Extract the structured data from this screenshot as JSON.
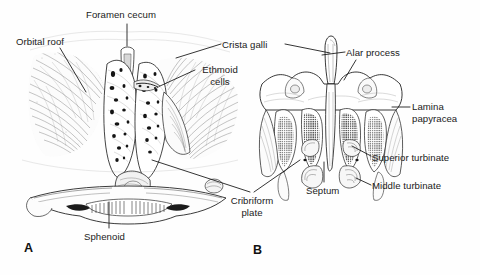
{
  "figure": {
    "kind": "anatomical-line-drawing",
    "ink_color": "#1b1b1b",
    "background_color": "#fefefe"
  },
  "panels": [
    {
      "letter": "A",
      "caption_x": 24,
      "caption_y": 241
    },
    {
      "letter": "B",
      "caption_x": 253,
      "caption_y": 243
    }
  ],
  "labels": [
    {
      "name": "orbital-roof",
      "text": "Orbital roof",
      "x": 16,
      "y": 36,
      "align": "left",
      "width": 74
    },
    {
      "name": "foramen-cecum",
      "text": "Foramen cecum",
      "x": 86,
      "y": 9,
      "align": "left",
      "width": 86
    },
    {
      "name": "crista-galli",
      "text": "Crista galli",
      "x": 222,
      "y": 39,
      "align": "left",
      "width": 62
    },
    {
      "name": "ethmoid-cells",
      "text": "Ethmoid\ncells",
      "x": 196,
      "y": 64,
      "align": "left",
      "width": 48
    },
    {
      "name": "alar-process",
      "text": "Alar process",
      "x": 346,
      "y": 47,
      "align": "left",
      "width": 70
    },
    {
      "name": "lamina-papyracea",
      "text": "Lamina\npapyracea",
      "x": 412,
      "y": 101,
      "align": "left",
      "width": 62
    },
    {
      "name": "superior-turbinate",
      "text": "Superior turbinate",
      "x": 372,
      "y": 152,
      "align": "left",
      "width": 100
    },
    {
      "name": "middle-turbinate",
      "text": "Middle turbinate",
      "x": 372,
      "y": 180,
      "align": "left",
      "width": 92
    },
    {
      "name": "septum",
      "text": "Septum",
      "x": 306,
      "y": 185,
      "align": "left",
      "width": 44
    },
    {
      "name": "cribriform-plate",
      "text": "Cribriform\nplate",
      "x": 224,
      "y": 195,
      "align": "center",
      "width": 56
    },
    {
      "name": "sphenoid",
      "text": "Sphenoid",
      "x": 84,
      "y": 231,
      "align": "left",
      "width": 54
    }
  ],
  "leader_lines": [
    {
      "name": "leader-orbital-roof",
      "points": "60,48 86,92"
    },
    {
      "name": "leader-foramen-cecum",
      "points": "127,24 127,46"
    },
    {
      "name": "leader-crista-galli-left",
      "points": "221,44 176,58"
    },
    {
      "name": "leader-crista-galli-right",
      "points": "285,44 330,53"
    },
    {
      "name": "leader-ethmoid-cells",
      "points": "195,70 160,86"
    },
    {
      "name": "leader-alar-process",
      "points": "345,52 322,55"
    },
    {
      "name": "leader-alar-process-2",
      "points": "356,60 344,80"
    },
    {
      "name": "leader-lamina-papyracea",
      "points": "410,107 392,107"
    },
    {
      "name": "leader-superior-turbinate",
      "points": "371,156 352,146"
    },
    {
      "name": "leader-middle-turbinate",
      "points": "371,185 356,178"
    },
    {
      "name": "leader-septum",
      "points": "324,182 324,162"
    },
    {
      "name": "leader-cribriform-a",
      "points": "250,192 152,160"
    },
    {
      "name": "leader-cribriform-b",
      "points": "254,192 300,160"
    },
    {
      "name": "leader-sphenoid",
      "points": "109,228 109,202"
    }
  ]
}
